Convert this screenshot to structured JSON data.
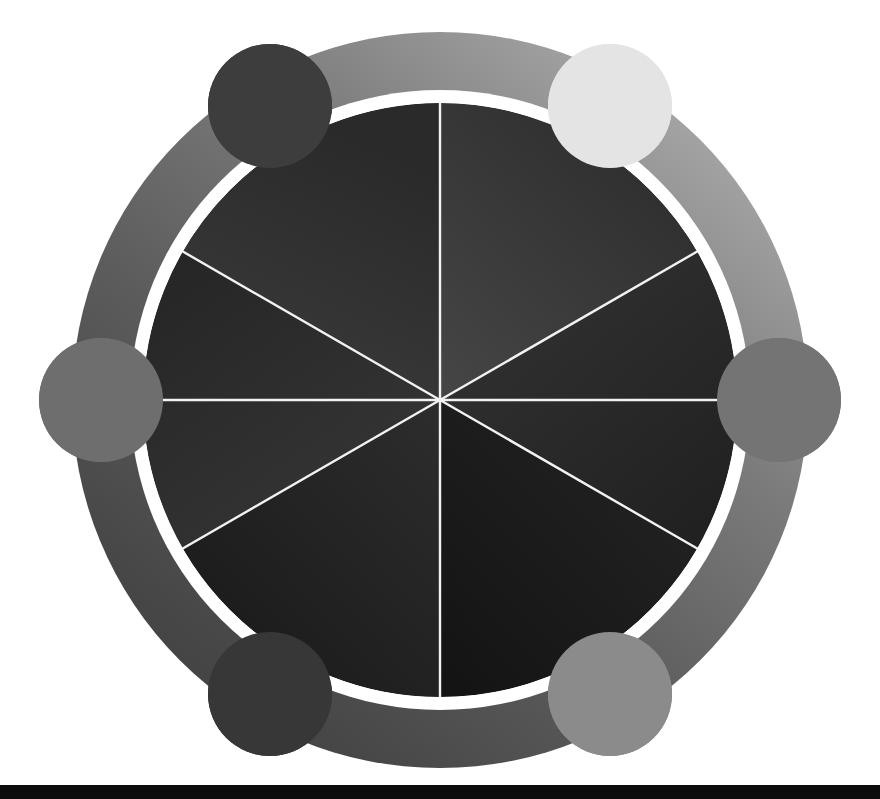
{
  "figure": {
    "background_color": "#ffffff",
    "width": 880,
    "height": 799
  },
  "geometry": {
    "center_x": 440,
    "center_y": 400,
    "outer_ring_outer_radius": 368,
    "outer_ring_inner_radius": 310,
    "gap_ring_radius": 303,
    "inner_disk_radius": 297,
    "node_radius": 62,
    "node_orbit_radius": 339,
    "sector_count": 6,
    "divider_color": "#f2f2f2",
    "divider_width": 2.4
  },
  "outer_ring": {
    "name": "outer-ring",
    "gradient_stops": [
      {
        "offset": "0%",
        "color": "#d8d8d8"
      },
      {
        "offset": "22%",
        "color": "#9a9a9a"
      },
      {
        "offset": "48%",
        "color": "#6f6f6f"
      },
      {
        "offset": "74%",
        "color": "#4a4a4a"
      },
      {
        "offset": "100%",
        "color": "#3a3a3a"
      }
    ],
    "gradient_angle_deg": 225
  },
  "inner_disk": {
    "name": "inner-disk",
    "base_color": "#2b2b2b",
    "highlight_color": "#4a4a4a",
    "shadow_color": "#141414",
    "sectors": [
      {
        "index": 0,
        "label": "sector-1",
        "start_deg": -90,
        "end_deg": -30,
        "fill": "#303030"
      },
      {
        "index": 1,
        "label": "sector-2",
        "start_deg": -30,
        "end_deg": 30,
        "fill": "#3b3b3b"
      },
      {
        "index": 2,
        "label": "sector-3",
        "start_deg": 30,
        "end_deg": 90,
        "fill": "#262626"
      },
      {
        "index": 3,
        "label": "sector-4",
        "start_deg": 90,
        "end_deg": 150,
        "fill": "#1c1c1c"
      },
      {
        "index": 4,
        "label": "sector-5",
        "start_deg": 150,
        "end_deg": 210,
        "fill": "#262626"
      },
      {
        "index": 5,
        "label": "sector-6",
        "start_deg": 210,
        "end_deg": 270,
        "fill": "#2e2e2e"
      }
    ]
  },
  "nodes": [
    {
      "id": "node-top-left",
      "angle_deg": 240,
      "cx": 270,
      "cy": 106,
      "r": 62,
      "color": "#3d3d3d"
    },
    {
      "id": "node-top-right",
      "angle_deg": 300,
      "cx": 610,
      "cy": 106,
      "r": 62,
      "color": "#e4e4e4"
    },
    {
      "id": "node-right",
      "angle_deg": 0,
      "cx": 779,
      "cy": 400,
      "r": 62,
      "color": "#747474"
    },
    {
      "id": "node-bottom-right",
      "angle_deg": 60,
      "cx": 610,
      "cy": 694,
      "r": 62,
      "color": "#8b8b8b"
    },
    {
      "id": "node-bottom-left",
      "angle_deg": 120,
      "cx": 270,
      "cy": 694,
      "r": 62,
      "color": "#373737"
    },
    {
      "id": "node-left",
      "angle_deg": 180,
      "cx": 101,
      "cy": 400,
      "r": 62,
      "color": "#6e6e6e"
    }
  ],
  "bottom_bar": {
    "name": "bottom-bar",
    "color": "#0d0d0d",
    "height": 14
  }
}
